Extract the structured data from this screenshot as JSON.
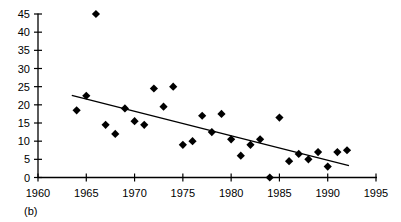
{
  "figure": {
    "panel_label": "(b)",
    "background_color": "#ffffff",
    "marker_color": "#000000",
    "line_color": "#000000"
  },
  "chart_data": {
    "type": "scatter",
    "title": "",
    "subtitle": "",
    "xlabel": "",
    "ylabel": "",
    "xlim": [
      1960,
      1995
    ],
    "ylim": [
      0,
      45
    ],
    "xticks": [
      1960,
      1965,
      1970,
      1975,
      1980,
      1985,
      1990,
      1995
    ],
    "xtick_labels": [
      "1960",
      "1965",
      "1970",
      "1975",
      "1980",
      "1985",
      "1990",
      "1995"
    ],
    "yticks": [
      0,
      5,
      10,
      15,
      20,
      25,
      30,
      35,
      40,
      45
    ],
    "ytick_labels": [
      "0",
      "5",
      "10",
      "15",
      "20",
      "25",
      "30",
      "35",
      "40",
      "45"
    ],
    "grid": false,
    "legend": false,
    "legend_position": "none",
    "marker_shape": "diamond",
    "annotations": [
      "(b)"
    ],
    "series": [
      {
        "name": "observations",
        "marker": "diamond",
        "color": "#000000",
        "x": [
          1964,
          1965,
          1966,
          1967,
          1968,
          1969,
          1970,
          1971,
          1972,
          1973,
          1974,
          1975,
          1976,
          1977,
          1978,
          1979,
          1980,
          1981,
          1982,
          1983,
          1984,
          1985,
          1986,
          1987,
          1988,
          1989,
          1990,
          1991,
          1992
        ],
        "y": [
          18.5,
          22.5,
          45.0,
          14.5,
          12.0,
          19.0,
          15.5,
          14.5,
          24.5,
          19.5,
          25.0,
          9.0,
          10.0,
          17.0,
          12.5,
          17.5,
          10.5,
          6.0,
          9.0,
          10.5,
          0.0,
          16.5,
          4.5,
          6.5,
          5.0,
          7.0,
          3.0,
          7.0,
          7.5
        ]
      },
      {
        "name": "trend-line",
        "type": "line",
        "color": "#000000",
        "x": [
          1963.5,
          1992.2
        ],
        "y": [
          22.6,
          3.3
        ]
      }
    ]
  }
}
